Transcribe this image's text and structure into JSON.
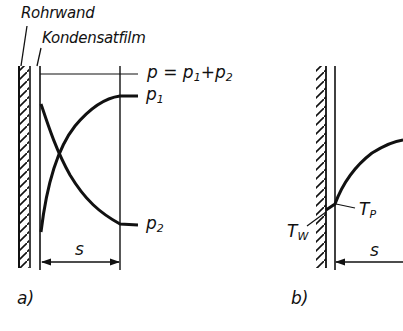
{
  "figure": {
    "labels": {
      "pipe_wall": "Rohrwand",
      "condensate_film": "Kondensatfilm"
    },
    "panel_a": {
      "caption": "a)",
      "total_pressure": {
        "p": "p",
        "eq": " = ",
        "p1": "p",
        "p1_sub": "1",
        "plus": "+",
        "p2": "p",
        "p2_sub": "2"
      },
      "curve_p1": {
        "name": "p",
        "sub": "1"
      },
      "curve_p2": {
        "name": "p",
        "sub": "2"
      },
      "dimension": "s"
    },
    "panel_b": {
      "caption": "b)",
      "wall_temp": {
        "name": "T",
        "sub": "W"
      },
      "interface_temp": {
        "name": "T",
        "sub": "P"
      },
      "dimension": "s"
    },
    "colors": {
      "ink": "#111111",
      "background": "#ffffff"
    }
  }
}
